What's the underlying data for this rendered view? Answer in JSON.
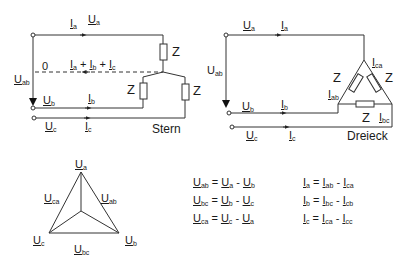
{
  "star": {
    "caption": "Stern",
    "neutral_label": "0",
    "neutral_current": {
      "parts": [
        "a",
        "b",
        "c"
      ],
      "symbol": "I"
    },
    "impedance": "Z",
    "labels": {
      "Ua": {
        "sym": "U",
        "sub": "a"
      },
      "Ia": {
        "sym": "I",
        "sub": "a"
      },
      "Ub": {
        "sym": "U",
        "sub": "b"
      },
      "Ib": {
        "sym": "I",
        "sub": "b"
      },
      "Uc": {
        "sym": "U",
        "sub": "c"
      },
      "Ic": {
        "sym": "I",
        "sub": "c"
      },
      "Uab": {
        "sym": "U",
        "sub": "ab"
      }
    }
  },
  "delta": {
    "caption": "Dreieck",
    "impedance": "Z",
    "labels": {
      "Ua": {
        "sym": "U",
        "sub": "a"
      },
      "Ia": {
        "sym": "I",
        "sub": "a"
      },
      "Ub": {
        "sym": "U",
        "sub": "b"
      },
      "Ib": {
        "sym": "I",
        "sub": "b"
      },
      "Uc": {
        "sym": "U",
        "sub": "c"
      },
      "Ic": {
        "sym": "I",
        "sub": "c"
      },
      "Uab": {
        "sym": "U",
        "sub": "ab"
      },
      "Iab": {
        "sym": "I",
        "sub": "ab"
      },
      "Ibc": {
        "sym": "I",
        "sub": "bc"
      },
      "Ica": {
        "sym": "I",
        "sub": "ca"
      }
    }
  },
  "phasor": {
    "vertices": {
      "a": "a",
      "b": "b",
      "c": "c"
    },
    "edges": {
      "ab": "ab",
      "bc": "bc",
      "ca": "ca"
    },
    "symbol": "U"
  },
  "equations": {
    "voltage": [
      {
        "lhs": [
          "U",
          "ab"
        ],
        "t1": [
          "U",
          "a"
        ],
        "op": "-",
        "t2": [
          "U",
          "b"
        ]
      },
      {
        "lhs": [
          "U",
          "bc"
        ],
        "t1": [
          "U",
          "b"
        ],
        "op": "-",
        "t2": [
          "U",
          "c"
        ]
      },
      {
        "lhs": [
          "U",
          "ca"
        ],
        "t1": [
          "U",
          "c"
        ],
        "op": "-",
        "t2": [
          "U",
          "a"
        ]
      }
    ],
    "current": [
      {
        "lhs": [
          "I",
          "a"
        ],
        "t1": [
          "I",
          "ab"
        ],
        "op": "-",
        "t2": [
          "I",
          "ca"
        ]
      },
      {
        "lhs": [
          "I",
          "b"
        ],
        "t1": [
          "I",
          "bc"
        ],
        "op": "-",
        "t2": [
          "I",
          "cb"
        ]
      },
      {
        "lhs": [
          "I",
          "c"
        ],
        "t1": [
          "I",
          "ca"
        ],
        "op": "-",
        "t2": [
          "I",
          "cc"
        ]
      }
    ]
  }
}
